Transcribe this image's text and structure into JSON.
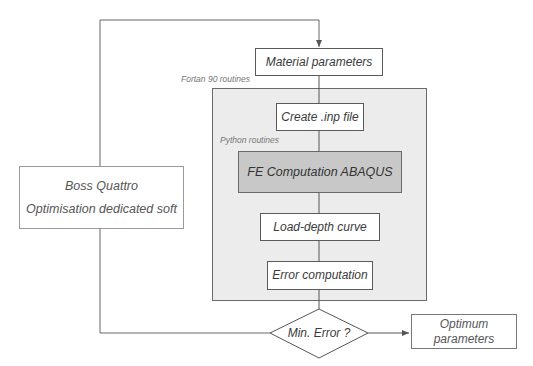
{
  "diagram": {
    "type": "flowchart",
    "labels": {
      "fortran": "Fortan 90 routines",
      "python": "Python routines"
    },
    "nodes": {
      "material_parameters": "Material parameters",
      "create_inp": "Create .inp file",
      "fe_computation": "FE Computation ABAQUS",
      "load_depth": "Load-depth curve",
      "error_computation": "Error computation",
      "min_error": "Min. Error ?",
      "optimum_line1": "Optimum",
      "optimum_line2": "parameters",
      "boss_line1": "Boss Quattro",
      "boss_line2": "Optimisation dedicated soft"
    },
    "edges": [
      {
        "from": "material_parameters",
        "to": "create_inp"
      },
      {
        "from": "create_inp",
        "to": "fe_computation"
      },
      {
        "from": "fe_computation",
        "to": "load_depth"
      },
      {
        "from": "load_depth",
        "to": "error_computation"
      },
      {
        "from": "error_computation",
        "to": "min_error"
      },
      {
        "from": "min_error",
        "to": "optimum_parameters"
      },
      {
        "from": "min_error",
        "to": "boss_quattro"
      },
      {
        "from": "boss_quattro",
        "to": "material_parameters"
      }
    ],
    "colors": {
      "container_fill": "#ececec",
      "fe_fill": "#c8c8c8",
      "line": "#555555"
    }
  }
}
